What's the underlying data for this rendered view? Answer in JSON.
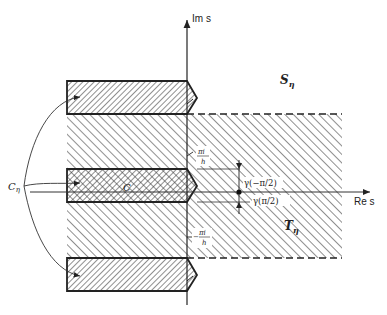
{
  "figure": {
    "axes": {
      "imaginary_label": "Im s",
      "real_label": "Re s"
    },
    "regions": {
      "S": {
        "label": "S",
        "subscript": "η"
      },
      "T": {
        "label": "T",
        "subscript": "η"
      }
    },
    "contour": {
      "label": "C",
      "subscript": "η",
      "strip_label": "C"
    },
    "ticks": {
      "upper": {
        "numerator": "πi",
        "denominator": "h"
      },
      "lower": {
        "prefix": "−",
        "numerator": "πi",
        "denominator": "h"
      }
    },
    "gamma_labels": {
      "upper": "γ(−π/2)",
      "lower": "γ(π/2)"
    },
    "colors": {
      "ink": "#222222",
      "hatch": "#333333",
      "background": "#ffffff"
    }
  }
}
